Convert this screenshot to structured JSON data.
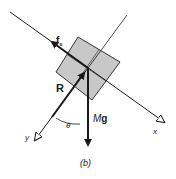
{
  "diagram": {
    "caption": "(b)",
    "labels": {
      "friction": "f",
      "friction_sub": "s",
      "normal": "R",
      "weight_M": "M",
      "weight_g": "g",
      "angle": "θ",
      "x_axis": "x",
      "y_axis": "y"
    },
    "colors": {
      "block_fill": "#c8c8c8",
      "line": "#1a1a1a",
      "background": "#ffffff"
    }
  }
}
